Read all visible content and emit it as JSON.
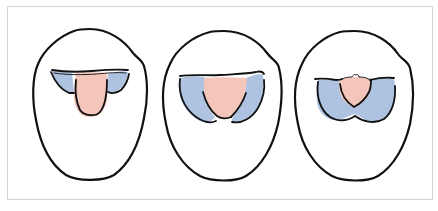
{
  "figure": {
    "panel_count": 3,
    "colors": {
      "outline": "#111111",
      "pink_region": "#f4c6bb",
      "blue_region": "#aec3e2",
      "frame_border": "#d4d4d4",
      "background": "#ffffff"
    },
    "panels": [
      {
        "id": 1,
        "description": "oval outline with small pink central lobe flanked by two small blue lateral lobes"
      },
      {
        "id": 2,
        "description": "oval outline with pink central lobe flanked by larger elongated blue lobes"
      },
      {
        "id": 3,
        "description": "oval outline with small pink central lobe surrounded by a broad blue region"
      }
    ]
  }
}
